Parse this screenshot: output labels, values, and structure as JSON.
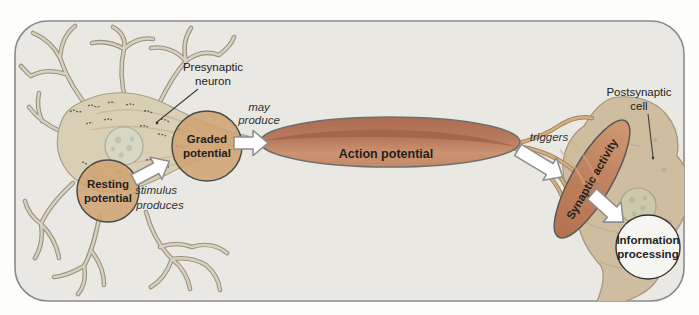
{
  "diagram": {
    "type": "flow-diagram",
    "annotations": {
      "presynaptic_neuron": {
        "lines": [
          "Presynaptic",
          "neuron"
        ]
      },
      "postsynaptic_cell": {
        "lines": [
          "Postsynaptic",
          "cell"
        ]
      }
    },
    "nodes": {
      "resting_potential": {
        "lines": [
          "Resting",
          "potential"
        ]
      },
      "graded_potential": {
        "lines": [
          "Graded",
          "potential"
        ]
      },
      "action_potential": {
        "label": "Action potential"
      },
      "synaptic_activity": {
        "label": "Synaptic activity"
      },
      "information_processing": {
        "lines": [
          "Information",
          "processing"
        ]
      }
    },
    "edges": [
      {
        "name": "stimulus-produces",
        "label_lines": [
          "stimulus",
          "produces"
        ],
        "from": "resting_potential",
        "to": "graded_potential"
      },
      {
        "name": "may-produce",
        "label_lines": [
          "may",
          "produce"
        ],
        "from": "graded_potential",
        "to": "action_potential"
      },
      {
        "name": "triggers",
        "label": "triggers",
        "from": "action_potential",
        "to": "synaptic_activity"
      },
      {
        "name": "synapse-to-processing",
        "label": "",
        "from": "synaptic_activity",
        "to": "information_processing"
      }
    ],
    "colors": {
      "panel_background": "#eae8e3",
      "panel_border": "#8a8a8a",
      "neuron_fill": "#d8cfb4",
      "dendrite_stroke": "#9a927e",
      "potential_node_fill": "#cfa473",
      "action_potential_fill": "#b97a5e",
      "synaptic_activity_fill": "#c08260",
      "information_circle_fill": "#f6f5f1",
      "arrow_fill": "#ffffff",
      "arrow_border": "#8f8f8f",
      "label_text": "#1f1f1f"
    }
  }
}
